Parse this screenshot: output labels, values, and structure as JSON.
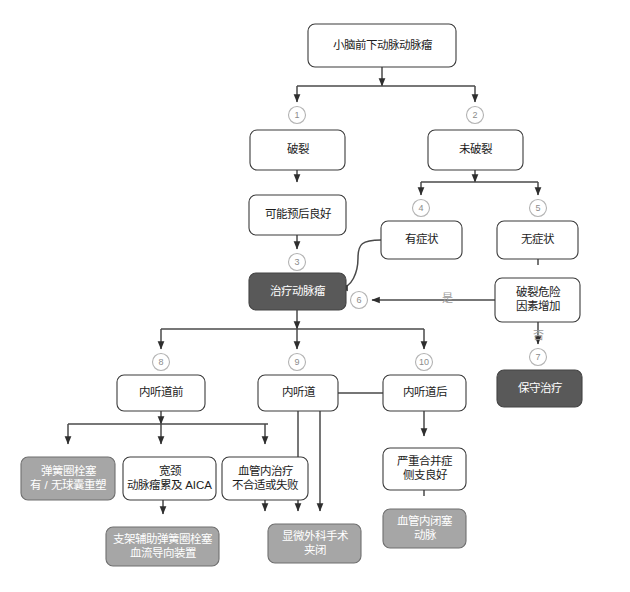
{
  "diagram": {
    "title": "小脑前下动脉动脉瘤",
    "background": "#ffffff",
    "colors": {
      "box_fill": "#ffffff",
      "box_stroke": "#3b3b3b",
      "gray_fill": "#a6a6a6",
      "gray_stroke": "#6f6f6f",
      "dark_fill": "#595959",
      "dark_stroke": "#444444",
      "edge": "#4a4a4a",
      "badge_stroke": "#b3b3b3",
      "badge_text": "#8c8c8c",
      "edge_label": "#9a9a9a",
      "text": "#1c1c1c",
      "text_on_fill": "#ffffff"
    },
    "nodes": [
      {
        "id": "root",
        "style": "plain",
        "x": 308,
        "y": 24,
        "w": 148,
        "h": 43,
        "lines": [
          "小脑前下动脉动脉瘤"
        ]
      },
      {
        "id": "ruptured",
        "style": "plain",
        "x": 250,
        "y": 130,
        "w": 95,
        "h": 40,
        "lines": [
          "破裂"
        ]
      },
      {
        "id": "unruptured",
        "style": "plain",
        "x": 428,
        "y": 130,
        "w": 95,
        "h": 40,
        "lines": [
          "未破裂"
        ]
      },
      {
        "id": "good-prog",
        "style": "plain",
        "x": 249,
        "y": 195,
        "w": 97,
        "h": 40,
        "lines": [
          "可能预后良好"
        ]
      },
      {
        "id": "symptomatic",
        "style": "plain",
        "x": 381,
        "y": 221,
        "w": 81,
        "h": 38,
        "lines": [
          "有症状"
        ]
      },
      {
        "id": "asympt",
        "style": "plain",
        "x": 497,
        "y": 221,
        "w": 81,
        "h": 38,
        "lines": [
          "无症状"
        ]
      },
      {
        "id": "risk-up",
        "style": "plain",
        "x": 495,
        "y": 278,
        "w": 85,
        "h": 44,
        "lines": [
          "破裂危险",
          "因素增加"
        ]
      },
      {
        "id": "treat",
        "style": "dark",
        "x": 249,
        "y": 273,
        "w": 97,
        "h": 37,
        "lines": [
          "治疗动脉瘤"
        ]
      },
      {
        "id": "conservative",
        "style": "dark",
        "x": 497,
        "y": 370,
        "w": 85,
        "h": 37,
        "lines": [
          "保守治疗"
        ]
      },
      {
        "id": "pre-iac",
        "style": "plain",
        "x": 117,
        "y": 375,
        "w": 88,
        "h": 36,
        "lines": [
          "内听道前"
        ]
      },
      {
        "id": "iac",
        "style": "plain",
        "x": 258,
        "y": 375,
        "w": 80,
        "h": 36,
        "lines": [
          "内听道"
        ]
      },
      {
        "id": "post-iac",
        "style": "plain",
        "x": 383,
        "y": 375,
        "w": 83,
        "h": 36,
        "lines": [
          "内听道后"
        ]
      },
      {
        "id": "coiling",
        "style": "gray",
        "x": 21,
        "y": 457,
        "w": 94,
        "h": 43,
        "lines": [
          "弹簧圈栓塞",
          "有 / 无球囊重塑"
        ]
      },
      {
        "id": "wide-neck",
        "style": "plain",
        "x": 123,
        "y": 457,
        "w": 93,
        "h": 43,
        "lines": [
          "宽颈",
          "动脉瘤累及 AICA"
        ]
      },
      {
        "id": "endo-fail",
        "style": "plain",
        "x": 222,
        "y": 457,
        "w": 86,
        "h": 43,
        "lines": [
          "血管内治疗",
          "不合适或失败"
        ]
      },
      {
        "id": "severe-comp",
        "style": "plain",
        "x": 383,
        "y": 448,
        "w": 83,
        "h": 42,
        "lines": [
          "严重合并症",
          "侧支良好"
        ]
      },
      {
        "id": "stent",
        "style": "gray",
        "x": 106,
        "y": 527,
        "w": 113,
        "h": 39,
        "lines": [
          "支架辅助弹簧圈栓塞",
          "血流导向装置"
        ]
      },
      {
        "id": "micro-clip",
        "style": "gray",
        "x": 268,
        "y": 524,
        "w": 93,
        "h": 39,
        "lines": [
          "显微外科手术",
          "夹闭"
        ]
      },
      {
        "id": "endo-occl",
        "style": "gray",
        "x": 383,
        "y": 509,
        "w": 83,
        "h": 39,
        "lines": [
          "血管内闭塞",
          "动脉"
        ]
      }
    ],
    "badges": [
      {
        "id": "b1",
        "label": "1",
        "cx": 297,
        "cy": 115
      },
      {
        "id": "b2",
        "label": "2",
        "cx": 475,
        "cy": 115
      },
      {
        "id": "b3",
        "label": "3",
        "cx": 297,
        "cy": 262
      },
      {
        "id": "b4",
        "label": "4",
        "cx": 421,
        "cy": 208
      },
      {
        "id": "b5",
        "label": "5",
        "cx": 538,
        "cy": 208
      },
      {
        "id": "b6",
        "label": "6",
        "cx": 359,
        "cy": 300
      },
      {
        "id": "b7",
        "label": "7",
        "cx": 538,
        "cy": 357
      },
      {
        "id": "b8",
        "label": "8",
        "cx": 161,
        "cy": 362
      },
      {
        "id": "b9",
        "label": "9",
        "cx": 297,
        "cy": 362
      },
      {
        "id": "b10",
        "label": "10",
        "cx": 424,
        "cy": 362
      }
    ],
    "edge_labels": [
      {
        "id": "yes",
        "label": "是",
        "x": 447,
        "y": 299
      },
      {
        "id": "no",
        "label": "否",
        "x": 538,
        "y": 336
      }
    ],
    "edges": [
      {
        "id": "root-to-split",
        "from": "root",
        "to": "branch",
        "d": "M382,67 L382,86 M297,86 L475,86 M297,86 L297,102 M475,86 L475,102"
      },
      {
        "id": "rupt-to-prog",
        "from": "ruptured",
        "to": "good-prog",
        "d": "M297,170 L297,182"
      },
      {
        "id": "prog-to-treat",
        "from": "good-prog",
        "to": "treat",
        "d": "M297,235 L297,249"
      },
      {
        "id": "unrupt-split",
        "from": "unruptured",
        "to": "sym-asym",
        "d": "M475,170 L475,182 M421,182 L538,182 M421,182 L421,195 M538,182 L538,195"
      },
      {
        "id": "asym-to-risk",
        "from": "asympt",
        "to": "risk-up",
        "d": "M538,259 L538,265"
      },
      {
        "id": "sym-to-treat",
        "from": "symptomatic",
        "to": "treat",
        "d": "M381,240 C362,240 358,244 358,258 C358,272 352,288 340,288"
      },
      {
        "id": "risk-yes-treat",
        "from": "risk-up",
        "to": "treat",
        "d": "M495,300 L372,300"
      },
      {
        "id": "risk-no-cons",
        "from": "risk-up",
        "to": "conservative",
        "d": "M538,322 L538,344"
      },
      {
        "id": "treat-split",
        "from": "treat",
        "to": "iac-levels",
        "d": "M297,310 L297,329 M161,329 L424,329 M161,329 L161,349 M297,329 L297,349 M424,329 L424,349"
      },
      {
        "id": "pre-iac-split",
        "from": "pre-iac",
        "to": "pre-options",
        "d": "M161,411 L161,424 M68,424 L268,424 M68,424 L68,444 M161,424 L161,444 M265,424 L265,444"
      },
      {
        "id": "wide-to-stent",
        "from": "wide-neck",
        "to": "stent",
        "d": "M163,500 L163,514"
      },
      {
        "id": "endofail-to-clip",
        "from": "endo-fail",
        "to": "micro-clip",
        "d": "M265,500 L265,511"
      },
      {
        "id": "iac-to-clip",
        "from": "iac",
        "to": "micro-clip",
        "d": "M298,411 L298,511"
      },
      {
        "id": "postiac-to-clip",
        "from": "post-iac",
        "to": "micro-clip",
        "d": "M383,393 L330,393 C322,393 320,398 320,408 L320,511"
      },
      {
        "id": "postiac-to-comp",
        "from": "post-iac",
        "to": "severe-comp",
        "d": "M424,411 L424,436"
      },
      {
        "id": "comp-to-occl",
        "from": "severe-comp",
        "to": "endo-occl",
        "d": "M424,490 L424,496"
      }
    ]
  }
}
